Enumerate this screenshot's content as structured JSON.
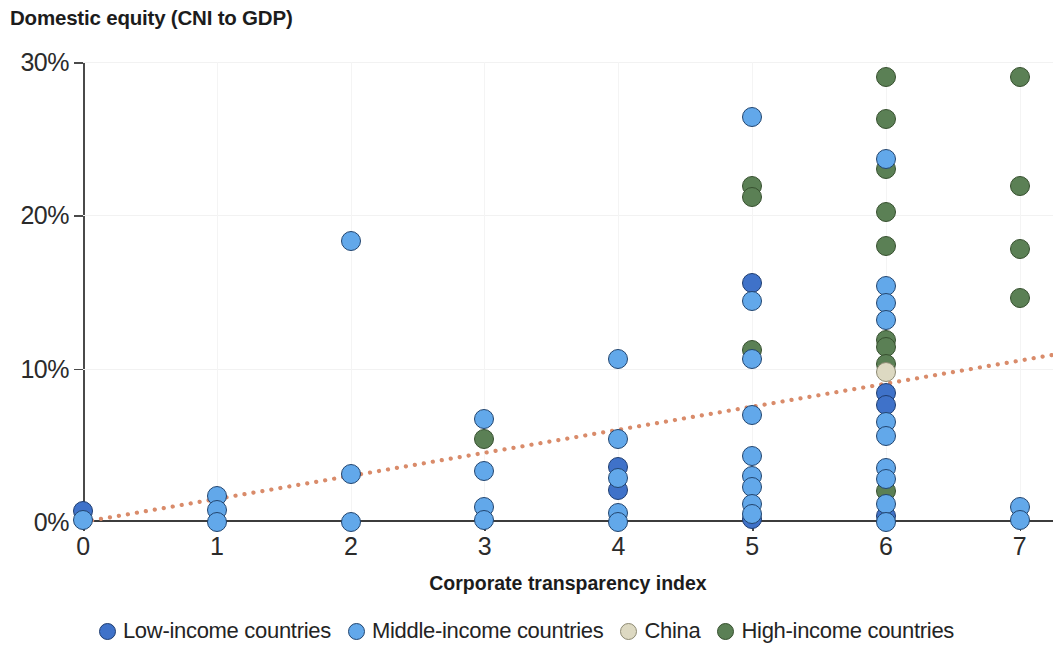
{
  "chart_data": {
    "type": "scatter",
    "title": "Domestic equity (CNI to GDP)",
    "xlabel": "Corporate transparency index",
    "ylabel": "",
    "xlim": [
      0,
      7.25
    ],
    "ylim": [
      0,
      30
    ],
    "grid": true,
    "legend_position": "bottom",
    "x_ticks": [
      "0",
      "1",
      "2",
      "3",
      "4",
      "5",
      "6",
      "7"
    ],
    "x_tick_values": [
      0,
      1,
      2,
      3,
      4,
      5,
      6,
      7
    ],
    "y_ticks": [
      "0%",
      "10%",
      "20%",
      "30%"
    ],
    "y_tick_values": [
      0,
      10,
      20,
      30
    ],
    "series": [
      {
        "name": "Low-income countries",
        "color": "#3f72c9",
        "points": [
          {
            "x": 0,
            "y": 0.7
          },
          {
            "x": 4,
            "y": 3.6
          },
          {
            "x": 4,
            "y": 2.1
          },
          {
            "x": 5,
            "y": 15.6
          },
          {
            "x": 5,
            "y": 0.2
          },
          {
            "x": 6,
            "y": 8.4
          },
          {
            "x": 6,
            "y": 7.6
          },
          {
            "x": 6,
            "y": 0.4
          }
        ]
      },
      {
        "name": "Middle-income countries",
        "color": "#62a8ea",
        "points": [
          {
            "x": 0,
            "y": 0.1
          },
          {
            "x": 1,
            "y": 1.7
          },
          {
            "x": 1,
            "y": 0.8
          },
          {
            "x": 1,
            "y": 0.0
          },
          {
            "x": 2,
            "y": 18.3
          },
          {
            "x": 2,
            "y": 3.1
          },
          {
            "x": 2,
            "y": 0.0
          },
          {
            "x": 3,
            "y": 6.7
          },
          {
            "x": 3,
            "y": 3.3
          },
          {
            "x": 3,
            "y": 1.0
          },
          {
            "x": 3,
            "y": 0.1
          },
          {
            "x": 4,
            "y": 10.6
          },
          {
            "x": 4,
            "y": 5.4
          },
          {
            "x": 4,
            "y": 2.9
          },
          {
            "x": 4,
            "y": 0.6
          },
          {
            "x": 4,
            "y": 0.0
          },
          {
            "x": 5,
            "y": 26.4
          },
          {
            "x": 5,
            "y": 14.4
          },
          {
            "x": 5,
            "y": 10.6
          },
          {
            "x": 5,
            "y": 7.0
          },
          {
            "x": 5,
            "y": 4.3
          },
          {
            "x": 5,
            "y": 3.0
          },
          {
            "x": 5,
            "y": 2.3
          },
          {
            "x": 5,
            "y": 1.2
          },
          {
            "x": 5,
            "y": 0.5
          },
          {
            "x": 6,
            "y": 23.7
          },
          {
            "x": 6,
            "y": 15.4
          },
          {
            "x": 6,
            "y": 14.3
          },
          {
            "x": 6,
            "y": 13.2
          },
          {
            "x": 6,
            "y": 6.5
          },
          {
            "x": 6,
            "y": 5.6
          },
          {
            "x": 6,
            "y": 3.5
          },
          {
            "x": 6,
            "y": 2.8
          },
          {
            "x": 6,
            "y": 1.2
          },
          {
            "x": 6,
            "y": 0.0
          },
          {
            "x": 7,
            "y": 1.0
          },
          {
            "x": 7,
            "y": 0.1
          }
        ]
      },
      {
        "name": "China",
        "color": "#ddd9c2",
        "points": [
          {
            "x": 6,
            "y": 9.8
          }
        ]
      },
      {
        "name": "High-income countries",
        "color": "#5b8055",
        "points": [
          {
            "x": 3,
            "y": 5.4
          },
          {
            "x": 5,
            "y": 21.9
          },
          {
            "x": 5,
            "y": 21.2
          },
          {
            "x": 5,
            "y": 11.2
          },
          {
            "x": 6,
            "y": 29.0
          },
          {
            "x": 6,
            "y": 26.3
          },
          {
            "x": 6,
            "y": 23.0
          },
          {
            "x": 6,
            "y": 20.2
          },
          {
            "x": 6,
            "y": 18.0
          },
          {
            "x": 6,
            "y": 11.9
          },
          {
            "x": 6,
            "y": 11.4
          },
          {
            "x": 6,
            "y": 10.3
          },
          {
            "x": 6,
            "y": 2.0
          },
          {
            "x": 7,
            "y": 29.0
          },
          {
            "x": 7,
            "y": 21.9
          },
          {
            "x": 7,
            "y": 17.8
          },
          {
            "x": 7,
            "y": 14.6
          }
        ]
      }
    ],
    "trendline": {
      "name": "fit",
      "color": "#d98b6a",
      "style": "dotted",
      "x_start": 0,
      "y_start": 0,
      "x_end": 7.25,
      "y_end": 10.9
    }
  },
  "legend": {
    "items": [
      {
        "label": "Low-income countries",
        "key": "low"
      },
      {
        "label": "Middle-income countries",
        "key": "middle"
      },
      {
        "label": "China",
        "key": "china"
      },
      {
        "label": "High-income countries",
        "key": "high"
      }
    ]
  }
}
